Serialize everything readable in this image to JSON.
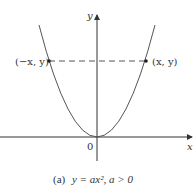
{
  "figure": {
    "caption_prefix": "(a)",
    "caption_equation": "y = ax², a > 0",
    "axes": {
      "x_label": "x",
      "y_label": "y",
      "origin_label": "0"
    },
    "points": [
      {
        "label": "(−x, y)",
        "side": "left"
      },
      {
        "label": "(x, y)",
        "side": "right"
      }
    ],
    "colors": {
      "curve": "#555555",
      "axis": "#333333",
      "dashed": "#555555",
      "text": "#333333"
    }
  }
}
